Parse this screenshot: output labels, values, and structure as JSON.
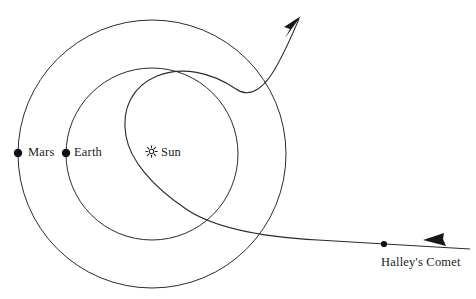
{
  "diagram": {
    "type": "orbital-diagram",
    "background_color": "#ffffff",
    "stroke_color": "#2a2a32",
    "text_color": "#1c1c22",
    "labels": {
      "mars": "Mars",
      "earth": "Earth",
      "sun": "Sun",
      "comet": "Halley's Comet"
    },
    "icons": {
      "sun": "sun-icon",
      "mars": "planet-dot-icon",
      "earth": "planet-dot-icon",
      "comet": "comet-dot-icon",
      "comet_outbound_arrow": "arrow-up-right-icon",
      "comet_inbound_arrow": "arrow-left-icon"
    },
    "geometry": {
      "center": {
        "x": 152,
        "y": 154
      },
      "mars_orbit_radius": 134,
      "earth_orbit_radius": 86,
      "mars_dot": {
        "x": 18,
        "y": 153
      },
      "earth_dot": {
        "x": 66,
        "y": 153
      },
      "comet_dot": {
        "x": 384,
        "y": 244
      },
      "comet_outbound_arrow_tip": {
        "x": 301,
        "y": 17
      },
      "comet_inbound_arrow_tip": {
        "x": 424,
        "y": 240
      }
    }
  }
}
